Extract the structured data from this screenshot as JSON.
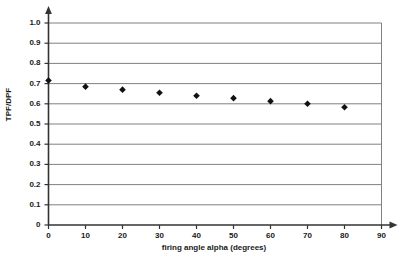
{
  "chart_data": {
    "type": "scatter",
    "title": "",
    "xlabel": "firing angle alpha (degrees)",
    "ylabel": "TPF/DPF",
    "x": [
      0,
      10,
      20,
      30,
      40,
      50,
      60,
      70,
      80
    ],
    "values": [
      0.715,
      0.685,
      0.67,
      0.655,
      0.64,
      0.628,
      0.613,
      0.6,
      0.583
    ],
    "xlim": [
      0,
      90
    ],
    "ylim": [
      0,
      1.0
    ],
    "xticks": [
      "0",
      "10",
      "20",
      "30",
      "40",
      "50",
      "60",
      "70",
      "80",
      "90"
    ],
    "xtick_values": [
      0,
      10,
      20,
      30,
      40,
      50,
      60,
      70,
      80,
      90
    ],
    "yticks": [
      "0",
      "0.1",
      "0.2",
      "0.3",
      "0.4",
      "0.5",
      "0.6",
      "0.7",
      "0.8",
      "0.9",
      "1.0"
    ],
    "ytick_values": [
      0,
      0.1,
      0.2,
      0.3,
      0.4,
      0.5,
      0.6,
      0.7,
      0.8,
      0.9,
      1.0
    ],
    "grid": "horizontal",
    "legend": "none",
    "marker": "diamond",
    "marker_color": "#111111",
    "gridline_color": "#808080",
    "axis_color": "#333333",
    "plot_background": "#ffffff",
    "series": [
      {
        "name": "TPF/DPF",
        "values": [
          0.715,
          0.685,
          0.67,
          0.655,
          0.64,
          0.628,
          0.613,
          0.6,
          0.583
        ]
      }
    ]
  }
}
